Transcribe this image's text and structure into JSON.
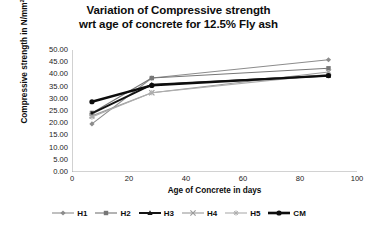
{
  "chart_data": {
    "type": "line",
    "title": "Variation of Compressive strength wrt age of concrete for 12.5% Fly ash",
    "title_line1": "Variation of Compressive strength",
    "title_line2": "wrt age of concrete for 12.5% Fly ash",
    "xlabel": "Age of Concrete in days",
    "ylabel": "Compressive strength in N/mm",
    "ylabel_sup": "2",
    "x": [
      7,
      28,
      90
    ],
    "xlim": [
      0,
      100
    ],
    "ylim": [
      0,
      50
    ],
    "xticks": [
      "0",
      "20",
      "40",
      "60",
      "80",
      "100"
    ],
    "xtick_values": [
      0,
      20,
      40,
      60,
      80,
      100
    ],
    "yticks": [
      "0.00",
      "5.00",
      "10.00",
      "15.00",
      "20.00",
      "25.00",
      "30.00",
      "35.00",
      "40.00",
      "45.00",
      "50.00"
    ],
    "ytick_values": [
      0,
      5,
      10,
      15,
      20,
      25,
      30,
      35,
      40,
      45,
      50
    ],
    "grid": false,
    "legend_position": "bottom",
    "series": [
      {
        "name": "H1",
        "marker": "diamond",
        "color": "#8c8c8c",
        "width": 1.1,
        "values": [
          19.7,
          38.5,
          46.0
        ]
      },
      {
        "name": "H2",
        "marker": "square",
        "color": "#767676",
        "width": 1.1,
        "values": [
          24.2,
          38.5,
          42.5
        ]
      },
      {
        "name": "H3",
        "marker": "triangle",
        "color": "#141414",
        "width": 1.9,
        "values": [
          24.0,
          35.8,
          39.5
        ]
      },
      {
        "name": "H4",
        "marker": "cross",
        "color": "#9a9a9a",
        "width": 1.1,
        "values": [
          23.0,
          32.5,
          41.0
        ]
      },
      {
        "name": "H5",
        "marker": "star",
        "color": "#aeaeae",
        "width": 1.1,
        "values": [
          22.5,
          32.5,
          40.0
        ]
      },
      {
        "name": "CM",
        "marker": "circle",
        "color": "#0d0d0d",
        "width": 2.4,
        "values": [
          28.8,
          35.5,
          39.5
        ]
      }
    ]
  },
  "legend": {
    "items": [
      {
        "label": "H1"
      },
      {
        "label": "H2"
      },
      {
        "label": "H3"
      },
      {
        "label": "H4"
      },
      {
        "label": "H5"
      },
      {
        "label": "CM"
      }
    ]
  }
}
